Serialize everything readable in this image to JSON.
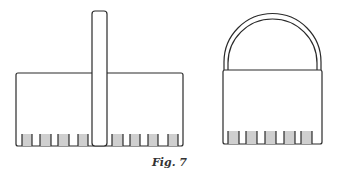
{
  "figure": {
    "caption": "Fig. 7",
    "stroke_color": "#2a2a2a",
    "slat_fill": "#cfcfcf",
    "left_basket": {
      "box": {
        "x": 16,
        "y": 73,
        "w": 167,
        "h": 73
      },
      "handle": {
        "x": 92,
        "y": 11,
        "w": 15,
        "h": 135
      },
      "slats": [
        {
          "x": 22,
          "w": 10
        },
        {
          "x": 40,
          "w": 11
        },
        {
          "x": 58,
          "w": 11
        },
        {
          "x": 78,
          "w": 10
        },
        {
          "x": 112,
          "w": 11
        },
        {
          "x": 130,
          "w": 10
        },
        {
          "x": 148,
          "w": 10
        },
        {
          "x": 168,
          "w": 10
        }
      ],
      "slat_top": 134
    },
    "right_basket": {
      "box": {
        "x": 223,
        "y": 70,
        "w": 99,
        "h": 74
      },
      "arch": {
        "outer_rx": 48,
        "inner_rx": 44,
        "top": 14
      },
      "slats": [
        {
          "x": 228,
          "w": 11
        },
        {
          "x": 246,
          "w": 11
        },
        {
          "x": 265,
          "w": 11
        },
        {
          "x": 284,
          "w": 11
        },
        {
          "x": 301,
          "w": 11
        }
      ],
      "slat_top": 131
    }
  }
}
